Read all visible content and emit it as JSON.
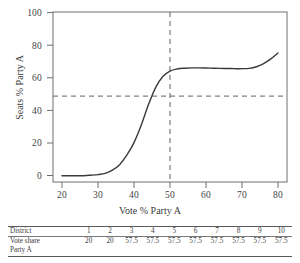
{
  "chart_data": {
    "type": "line",
    "title": "",
    "xlabel": "Vote % Party A",
    "ylabel": "Seats % Party A",
    "xlim": [
      17.5,
      82.5
    ],
    "ylim": [
      -4,
      104
    ],
    "xticks": [
      20,
      30,
      40,
      50,
      60,
      70,
      80
    ],
    "yticks": [
      0,
      20,
      40,
      60,
      80,
      100
    ],
    "grid": false,
    "legend": null,
    "annotations": [
      {
        "type": "vline",
        "value": 50,
        "style": "dashed"
      },
      {
        "type": "hline",
        "value": 50,
        "style": "dashed"
      }
    ],
    "series": [
      {
        "name": "seats-votes curve",
        "x": [
          20,
          22,
          24,
          26,
          28,
          30,
          32,
          34,
          36,
          38,
          40,
          42,
          44,
          46,
          48,
          50,
          52,
          54,
          56,
          58,
          60,
          62,
          64,
          66,
          68,
          70,
          72,
          74,
          76,
          78,
          80
        ],
        "y": [
          0,
          0,
          0,
          0,
          0.3,
          0.7,
          1.5,
          3.5,
          7,
          13,
          21,
          32,
          45,
          56,
          63,
          66.5,
          67.8,
          68.3,
          68.5,
          68.5,
          68.4,
          68.3,
          68.2,
          68.1,
          68.0,
          68.0,
          68.2,
          69.2,
          71.2,
          74.2,
          78.0
        ]
      }
    ]
  },
  "axes": {
    "x_tick_labels": [
      "20",
      "30",
      "40",
      "50",
      "60",
      "70",
      "80"
    ],
    "y_tick_labels": [
      "0",
      "20",
      "40",
      "60",
      "80",
      "100"
    ],
    "x_title": "Vote % Party A",
    "y_title": "Seats % Party A"
  },
  "table": {
    "rows": [
      {
        "label": "District",
        "values": [
          "1",
          "2",
          "3",
          "4",
          "5",
          "6",
          "7",
          "8",
          "9",
          "10"
        ]
      },
      {
        "label": "Vote share",
        "values": [
          "20",
          "20",
          "57.5",
          "57.5",
          "57.5",
          "57.5",
          "57.5",
          "57.5",
          "57.5",
          "57.5"
        ]
      },
      {
        "label": "Party A",
        "values": [
          "",
          "",
          "",
          "",
          "",
          "",
          "",
          "",
          "",
          ""
        ]
      }
    ]
  },
  "colors": {
    "background": "#ffffff",
    "curve": "#3a3a3a",
    "axis": "#6e6e6e",
    "dashed": "#606060",
    "text": "#3a3a3a"
  }
}
